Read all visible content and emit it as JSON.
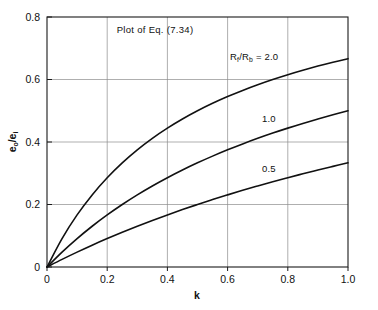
{
  "chart_data": {
    "type": "line",
    "title": "Plot of Eq. (7.34)",
    "xlabel": "k",
    "ylabel": "e₀/eᵢ",
    "ylabel_base": "e",
    "ylabel_sub1": "o",
    "ylabel_mid": "/e",
    "ylabel_sub2": "i",
    "xlim": [
      0,
      1.0
    ],
    "ylim": [
      0,
      0.8
    ],
    "grid": true,
    "legend_position": "inline-curve-labels",
    "xticks": [
      "0",
      "0.2",
      "0.4",
      "0.6",
      "0.8",
      "1.0"
    ],
    "xtick_values": [
      0,
      0.2,
      0.4,
      0.6,
      0.8,
      1.0
    ],
    "yticks": [
      "0",
      "0.2",
      "0.4",
      "0.6",
      "0.8"
    ],
    "ytick_values": [
      0,
      0.2,
      0.4,
      0.6,
      0.8
    ],
    "series_param_label": "R",
    "series_param_sub_num": "f",
    "series_param_sub_den": "b",
    "series_param_text": "R",
    "series_param_equals": " =  2.0",
    "x": [
      0,
      0.05,
      0.1,
      0.15,
      0.2,
      0.25,
      0.3,
      0.35,
      0.4,
      0.45,
      0.5,
      0.55,
      0.6,
      0.65,
      0.7,
      0.75,
      0.8,
      0.85,
      0.9,
      0.95,
      1.0
    ],
    "series": [
      {
        "name": "2.0",
        "label": "2.0",
        "ratio": 2.0,
        "values": [
          0,
          0.0909,
          0.1667,
          0.2308,
          0.2857,
          0.3333,
          0.375,
          0.4118,
          0.4444,
          0.4737,
          0.5,
          0.5238,
          0.5455,
          0.5652,
          0.5833,
          0.6,
          0.6154,
          0.6296,
          0.6429,
          0.6552,
          0.6667
        ]
      },
      {
        "name": "1.0",
        "label": "1.0",
        "ratio": 1.0,
        "values": [
          0,
          0.0476,
          0.0909,
          0.1304,
          0.1667,
          0.2,
          0.2308,
          0.2593,
          0.2857,
          0.3103,
          0.3333,
          0.3548,
          0.375,
          0.3939,
          0.4118,
          0.4286,
          0.4444,
          0.4595,
          0.4737,
          0.4872,
          0.5
        ]
      },
      {
        "name": "0.5",
        "label": "0.5",
        "ratio": 0.5,
        "values": [
          0,
          0.0244,
          0.0476,
          0.0698,
          0.0909,
          0.1111,
          0.1304,
          0.1489,
          0.1667,
          0.1837,
          0.2,
          0.2157,
          0.2308,
          0.2453,
          0.2593,
          0.2727,
          0.2857,
          0.2982,
          0.3103,
          0.322,
          0.3333
        ]
      }
    ],
    "annotations": [
      {
        "text": "R_f/R_b = 2.0",
        "x": 0.72,
        "y": 0.695
      },
      {
        "text": "1.0",
        "x": 0.79,
        "y": 0.455
      },
      {
        "text": "0.5",
        "x": 0.79,
        "y": 0.295
      }
    ],
    "colors": {
      "curve": "#111111",
      "grid": "#8d8d8d",
      "axis": "#1a1a1a",
      "background": "#ffffff"
    }
  }
}
